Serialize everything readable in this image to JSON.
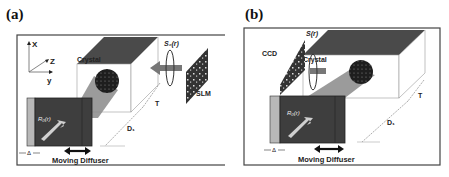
{
  "figure": {
    "panels": [
      {
        "id": "a",
        "label": "(a)",
        "axes": {
          "x": "X",
          "y": "y",
          "z": "Z"
        },
        "crystal_label": "Crystal",
        "signal_label": "S₀(r)",
        "device_label": "SLM",
        "reference_label": "R₀(r)",
        "thickness_label": "T",
        "distance_label": "D₁",
        "offset_label": "Δ",
        "diffuser_label": "Moving Diffuser"
      },
      {
        "id": "b",
        "label": "(b)",
        "device_label": "CCD",
        "signal_label": "S(r)",
        "crystal_label": "Crystal",
        "reference_label": "R₀(r)",
        "thickness_label": "T",
        "distance_label": "D₁",
        "offset_label": "Δ",
        "diffuser_label": "Moving Diffuser"
      }
    ]
  },
  "colors": {
    "frame": "#444444",
    "crystal_top": "#4a4a4a",
    "beam": "#8a8a8a",
    "diffuser": "#3e3e3e",
    "diffuser_edge": "#b8b8b8",
    "speckle": "#1e1e1e"
  }
}
